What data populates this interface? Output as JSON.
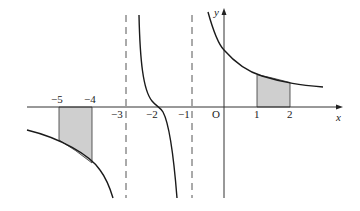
{
  "figure": {
    "type": "function graph with shaded areas",
    "axes": {
      "x_label": "x",
      "y_label": "y",
      "origin_label": "O"
    },
    "x_tick_labels": [
      {
        "value": -5,
        "label": "−5",
        "px": 59,
        "above": true
      },
      {
        "value": -4,
        "label": "−4",
        "px": 92,
        "above": true
      },
      {
        "value": -3,
        "label": "−3",
        "px": 120,
        "above": false
      },
      {
        "value": -2,
        "label": "−2",
        "px": 153,
        "above": false
      },
      {
        "value": -1,
        "label": "−1",
        "px": 185,
        "above": false
      },
      {
        "value": 1,
        "label": "1",
        "px": 257,
        "above": false
      },
      {
        "value": 2,
        "label": "2",
        "px": 290,
        "above": false
      }
    ],
    "asymptotes": [
      {
        "x": -3,
        "style": "dashed"
      },
      {
        "x": -1,
        "style": "dashed"
      }
    ],
    "shaded_regions": [
      {
        "from": -5,
        "to": -4,
        "side": "below x-axis"
      },
      {
        "from": 1,
        "to": 2,
        "side": "above x-axis"
      }
    ],
    "colors": {
      "curve": "#1a1a1a",
      "axis": "#333333",
      "shade": "#cfcfcf",
      "dash": "#555555"
    }
  }
}
